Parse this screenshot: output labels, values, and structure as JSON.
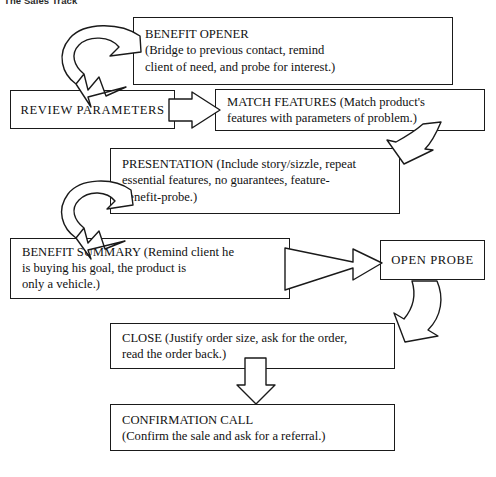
{
  "title": "The Sales Track",
  "diagram": {
    "type": "flowchart",
    "orientation": "top-to-bottom",
    "nodes": [
      {
        "id": "benefit-opener",
        "heading": "BENEFIT OPENER",
        "text": "BENEFIT OPENER\n(Bridge to previous contact, remind\nclient of need, and probe for interest.)",
        "align": "left"
      },
      {
        "id": "review-parameters",
        "heading": "REVIEW PARAMETERS",
        "text": "REVIEW PARAMETERS",
        "align": "center"
      },
      {
        "id": "match-features",
        "heading": "MATCH FEATURES",
        "text": "MATCH FEATURES (Match product's\nfeatures with parameters of problem.)",
        "align": "left"
      },
      {
        "id": "presentation",
        "heading": "PRESENTATION",
        "text": "PRESENTATION (Include story/sizzle, repeat\nessential features, no guarantees, feature-\nbenefit-probe.)",
        "align": "left"
      },
      {
        "id": "benefit-summary",
        "heading": "BENEFIT SUMMARY",
        "text": "BENEFIT SUMMARY (Remind client he\nis buying his goal, the product is\nonly a vehicle.)",
        "align": "left"
      },
      {
        "id": "open-probe",
        "heading": "OPEN PROBE",
        "text": "OPEN PROBE",
        "align": "center"
      },
      {
        "id": "close",
        "heading": "CLOSE",
        "text": "CLOSE (Justify order size, ask for the order,\nread the order back.)",
        "align": "left"
      },
      {
        "id": "confirmation-call",
        "heading": "CONFIRMATION CALL",
        "text": "CONFIRMATION CALL\n(Confirm the sale and ask for a referral.)",
        "align": "left"
      }
    ],
    "connectors": [
      {
        "id": "benefit-opener-to-review-parameters",
        "from": "benefit-opener",
        "to": "review-parameters",
        "style": "hooked-loop",
        "direction": "down-left"
      },
      {
        "id": "review-parameters-to-match-features",
        "from": "review-parameters",
        "to": "match-features",
        "style": "block",
        "direction": "right"
      },
      {
        "id": "match-features-to-presentation",
        "from": "match-features",
        "to": "presentation",
        "style": "bent",
        "direction": "down-left"
      },
      {
        "id": "presentation-to-benefit-summary",
        "from": "presentation",
        "to": "benefit-summary",
        "style": "hooked-loop",
        "direction": "down-left"
      },
      {
        "id": "benefit-summary-to-open-probe",
        "from": "benefit-summary",
        "to": "open-probe",
        "style": "tapered",
        "direction": "right"
      },
      {
        "id": "open-probe-to-close",
        "from": "open-probe",
        "to": "close",
        "style": "curved",
        "direction": "down-left"
      },
      {
        "id": "close-to-confirmation-call",
        "from": "close",
        "to": "confirmation-call",
        "style": "block",
        "direction": "down"
      }
    ]
  },
  "colors": {
    "ink": "#1a1a1a",
    "paper": "#ffffff",
    "title": "#2b2b2b"
  }
}
